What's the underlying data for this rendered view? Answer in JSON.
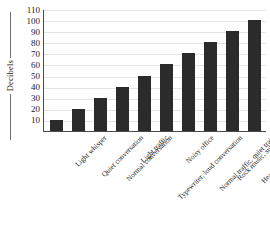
{
  "chart_data": {
    "type": "bar",
    "title": "",
    "xlabel": "",
    "ylabel": "Decibels",
    "ylim": [
      0,
      110
    ],
    "yticks": [
      10,
      20,
      30,
      40,
      50,
      60,
      70,
      80,
      90,
      100,
      110
    ],
    "grid": true,
    "legend": false,
    "bar_color": "#2b2b2b",
    "axis_color": "#4a4a4a",
    "gridline_color": "#e4e4e4",
    "categories": [
      "Light whisper",
      "Quiet conversation",
      "Normal conversation",
      "Light traffic",
      "Typewriter, loud conversation",
      "Noisy office",
      "Normal traffic, quiet train",
      "Rock music, subway",
      "Heavy traffic, thunder",
      "Jet plane at takeoff"
    ],
    "values": [
      10,
      20,
      30,
      40,
      50,
      60,
      70,
      80,
      90,
      100
    ]
  }
}
